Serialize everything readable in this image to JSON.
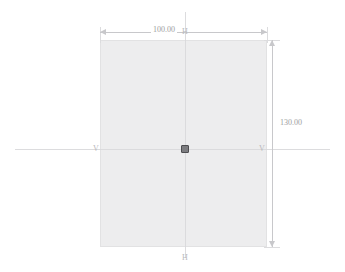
{
  "drawing": {
    "type": "2d-sketch",
    "background_color": "#ffffff",
    "part": {
      "shape": "rectangle",
      "fill_color": "#ededee",
      "outline_color": "#e2e2e3"
    },
    "dimensions": [
      {
        "id": "width",
        "orientation": "horizontal",
        "position": "top",
        "value": "100.00",
        "color": "#9d9da1"
      },
      {
        "id": "height",
        "orientation": "vertical",
        "position": "right",
        "value": "130.00",
        "color": "#9d9da1"
      }
    ],
    "centerlines": {
      "color": "#d8d8da",
      "horizontal_label": "V",
      "vertical_label": "H",
      "labels": {
        "top": "H",
        "bottom": "H",
        "left": "V",
        "right": "V"
      }
    },
    "origin": {
      "marker": "square-point",
      "color": "#7d7d80"
    }
  }
}
